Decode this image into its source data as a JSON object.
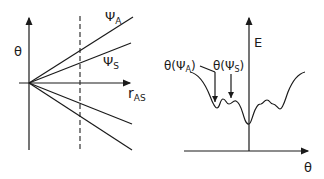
{
  "left_panel": {
    "y_axis_label": "θ",
    "x_axis_label_main": "r",
    "x_axis_label_sub": "AS",
    "lines": [
      {
        "name": "psi-A",
        "label_main": "Ψ",
        "label_sub": "A"
      },
      {
        "name": "psi-S",
        "label_main": "Ψ",
        "label_sub": "S"
      },
      {
        "name": "lower-1",
        "label_main": "",
        "label_sub": ""
      },
      {
        "name": "lower-2",
        "label_main": "",
        "label_sub": ""
      }
    ],
    "dashed_line": "fixed r_AS"
  },
  "right_panel": {
    "y_axis_label": "E",
    "x_axis_label": "θ",
    "annotation_a": "θ(Ψ",
    "annotation_a_sub": "A",
    "annotation_s": "θ(Ψ",
    "annotation_s_sub": "S",
    "close_paren": ")"
  },
  "colors": {
    "ink": "#1a1a1a",
    "background": "#ffffff"
  }
}
